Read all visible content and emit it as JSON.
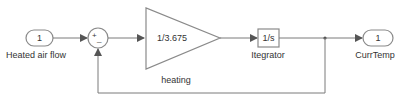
{
  "diagram": {
    "type": "simulink-block-diagram",
    "colors": {
      "line": "#7a7a7a",
      "block_border": "#8a8a8a",
      "text": "#333333",
      "background": "#ffffff"
    },
    "blocks": {
      "inport": {
        "number": "1",
        "label": "Heated air flow"
      },
      "sum": {
        "signs": "+_",
        "plus": "+",
        "minus": "_"
      },
      "gain": {
        "value": "1/3.675",
        "label": "heating"
      },
      "integrator": {
        "value": "1/s",
        "label": "Itegrator"
      },
      "outport": {
        "number": "1",
        "label": "CurrTemp"
      }
    },
    "connections": [
      {
        "from": "inport",
        "to": "sum"
      },
      {
        "from": "sum",
        "to": "gain"
      },
      {
        "from": "gain",
        "to": "integrator"
      },
      {
        "from": "integrator",
        "to": "outport"
      },
      {
        "from": "integrator",
        "to": "sum",
        "kind": "feedback"
      }
    ]
  }
}
